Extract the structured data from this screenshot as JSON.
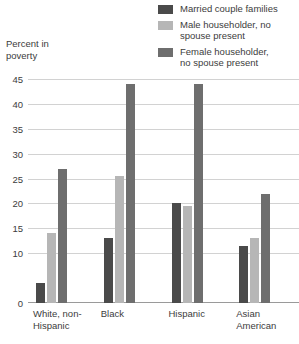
{
  "axis_title": "Percent in\npoverty",
  "legend": [
    {
      "label": "Married couple families",
      "color": "#4a4a4a"
    },
    {
      "label": "Male householder, no\nspouse present",
      "color": "#b6b6b6"
    },
    {
      "label": "Female householder,\nno spouse present",
      "color": "#6e6e6e"
    }
  ],
  "yticks": [
    "45",
    "40",
    "35",
    "30",
    "25",
    "20",
    "15",
    "10",
    "0"
  ],
  "xlabels": [
    "White, non-\nHispanic",
    "Black",
    "Hispanic",
    "Asian\nAmerican"
  ],
  "chart_data": {
    "type": "bar",
    "title": "",
    "xlabel": "",
    "ylabel": "Percent in poverty",
    "ylim": [
      0,
      45
    ],
    "grid": true,
    "legend_position": "top-right",
    "categories": [
      "White, non-Hispanic",
      "Black",
      "Hispanic",
      "Asian American"
    ],
    "series": [
      {
        "name": "Married couple families",
        "color": "#4a4a4a",
        "values": [
          4,
          13,
          20,
          11.5
        ]
      },
      {
        "name": "Male householder, no spouse present",
        "color": "#b6b6b6",
        "values": [
          14,
          25.5,
          19.5,
          13
        ]
      },
      {
        "name": "Female householder, no spouse present",
        "color": "#6e6e6e",
        "values": [
          27,
          44,
          44,
          22
        ]
      }
    ],
    "ytick_values": [
      0,
      10,
      15,
      20,
      25,
      30,
      35,
      40,
      45
    ]
  }
}
